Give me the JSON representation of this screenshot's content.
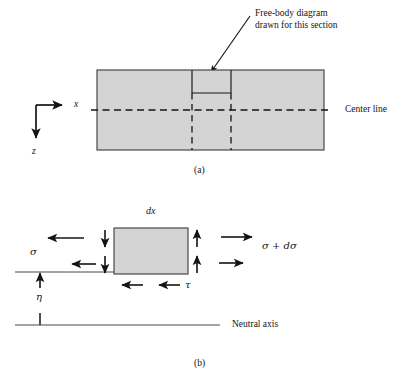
{
  "figure": {
    "title_caption_a": "(a)",
    "title_caption_b": "(b)",
    "colors": {
      "body_fill": "#d4d4d4",
      "stroke": "#1a1a1a",
      "background": "#ffffff"
    }
  },
  "panel_a": {
    "annotation_line1": "Free-body diagram",
    "annotation_line2": "drawn for this section",
    "center_line_label": "Center line",
    "axis_x_label": "x",
    "axis_z_label": "z",
    "caption": "(a)",
    "beam": {
      "x": 97,
      "y": 70,
      "width": 227,
      "height": 80
    },
    "section_left_x": 192,
    "section_right_x": 231,
    "section_bottom_y": 93,
    "center_line_y": 110,
    "axis_origin": {
      "x": 36,
      "y": 105
    },
    "axis_x_end": 62,
    "axis_z_end": 138
  },
  "panel_b": {
    "dx_label": "dx",
    "sigma_label": "σ",
    "sigma_plus_dsigma_label": "σ + dσ",
    "tau_label": "τ",
    "eta_label": "η",
    "neutral_axis_label": "Neutral axis",
    "caption": "(b)",
    "element": {
      "x": 114,
      "y": 228,
      "width": 74,
      "height": 46
    },
    "neutral_axis_y": 325,
    "upper_line_y": 272
  }
}
